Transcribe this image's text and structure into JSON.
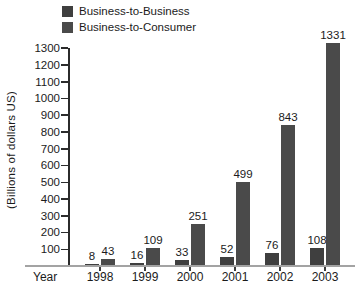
{
  "legend": {
    "items": [
      {
        "label": "Business-to-Business",
        "color": "#3f3f3f"
      },
      {
        "label": "Business-to-Consumer",
        "color": "#4a4a4a"
      }
    ]
  },
  "chart_data": {
    "type": "bar",
    "title": "",
    "categories": [
      "1998",
      "1999",
      "2000",
      "2001",
      "2002",
      "2003"
    ],
    "series": [
      {
        "name": "Business-to-Business",
        "values": [
          8,
          16,
          33,
          52,
          76,
          108
        ],
        "color": "#3f3f3f"
      },
      {
        "name": "Business-to-Consumer",
        "values": [
          43,
          109,
          251,
          499,
          843,
          1331
        ],
        "color": "#4a4a4a"
      }
    ],
    "xlabel": "Year",
    "ylabel": "(Billions of dollars US)",
    "ylim": [
      0,
      1300
    ],
    "ytick_step": 100,
    "y_ticks": [
      100,
      200,
      300,
      400,
      500,
      600,
      700,
      800,
      900,
      1000,
      1100,
      1200,
      1300
    ],
    "grid": false,
    "legend_position": "top-left",
    "bar_labels": true
  }
}
